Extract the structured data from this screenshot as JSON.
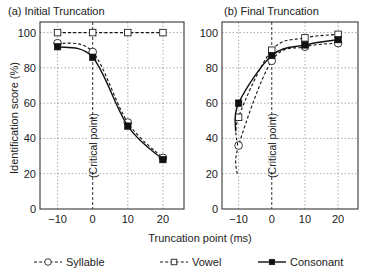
{
  "chart_data": {
    "type": "line",
    "xlabel": "Truncation point (ms)",
    "ylabel": "Identification score (%)",
    "legend_position": "bottom",
    "legend": [
      {
        "name": "Syllable",
        "style": "dashed",
        "marker": "open-circle"
      },
      {
        "name": "Vowel",
        "style": "dashed",
        "marker": "open-square"
      },
      {
        "name": "Consonant",
        "style": "solid",
        "marker": "filled-square"
      }
    ],
    "panels": [
      {
        "title": "(a) Initial Truncation",
        "annotation": "(Critical point)",
        "x": [
          -10,
          0,
          10,
          20
        ],
        "xticks": [
          "−10",
          "0",
          "10",
          "20"
        ],
        "yticks": [
          "0",
          "20",
          "40",
          "60",
          "80",
          "100"
        ],
        "xlim": [
          -15,
          26
        ],
        "ylim": [
          0,
          106
        ],
        "grid": true,
        "series": [
          {
            "name": "Syllable",
            "values": [
              94,
              89,
              49,
              29
            ]
          },
          {
            "name": "Vowel",
            "values": [
              100,
              100,
              100,
              100
            ]
          },
          {
            "name": "Consonant",
            "values": [
              92,
              86,
              47,
              28
            ]
          }
        ]
      },
      {
        "title": "(b) Final Truncation",
        "annotation": "(Critical point)",
        "x": [
          -10,
          0,
          10,
          20
        ],
        "xticks": [
          "−10",
          "0",
          "10",
          "20"
        ],
        "yticks": [
          "0",
          "20",
          "40",
          "60",
          "80",
          "100"
        ],
        "xlim": [
          -15,
          26
        ],
        "ylim": [
          0,
          106
        ],
        "grid": true,
        "series": [
          {
            "name": "Syllable",
            "values": [
              36,
              84,
              92,
              94
            ]
          },
          {
            "name": "Vowel",
            "values": [
              52,
              90,
              97,
              99
            ]
          },
          {
            "name": "Consonant",
            "values": [
              60,
              87,
              93,
              96
            ]
          }
        ]
      }
    ]
  }
}
